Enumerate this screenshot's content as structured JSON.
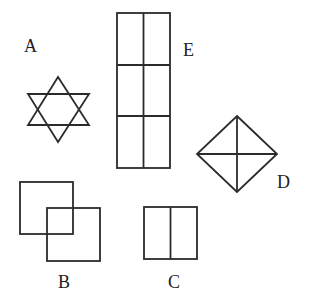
{
  "diagram": {
    "figures": [
      {
        "id": "A",
        "label": "A",
        "shape": "six-pointed-star"
      },
      {
        "id": "B",
        "label": "B",
        "shape": "two-overlapping-squares"
      },
      {
        "id": "C",
        "label": "C",
        "shape": "square-split-vertically-in-two"
      },
      {
        "id": "D",
        "label": "D",
        "shape": "diamond-with-cross"
      },
      {
        "id": "E",
        "label": "E",
        "shape": "rectangle-grid-3-rows-2-cols"
      }
    ],
    "colors": {
      "stroke": "#2b2b2b",
      "background": "#ffffff"
    }
  }
}
